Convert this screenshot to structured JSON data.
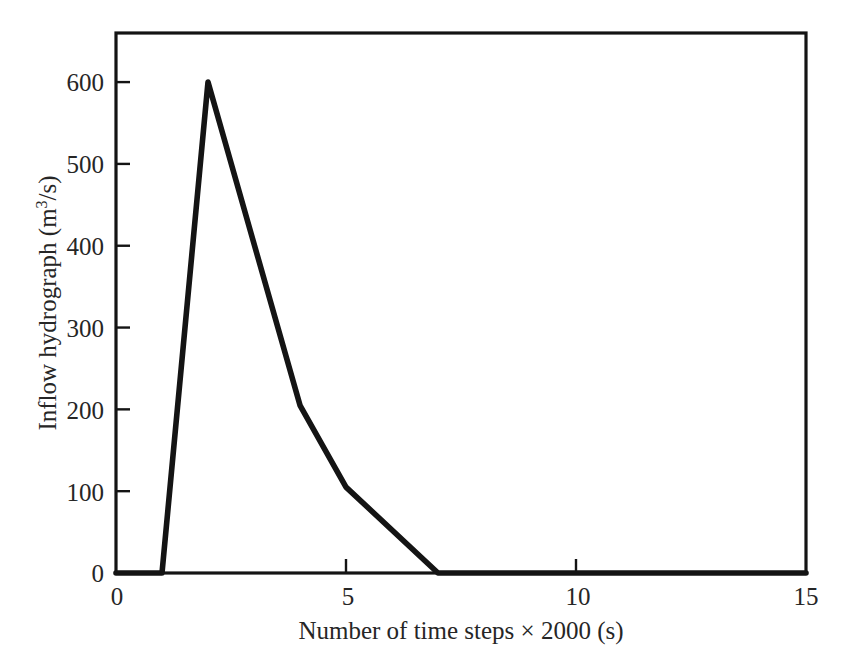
{
  "chart_data": {
    "type": "line",
    "title": "",
    "subtitle": "",
    "xlabel": "Number of time steps × 2000 (s)",
    "ylabel_main": "Inflow hydrograph (m",
    "ylabel_sup": "3",
    "ylabel_tail": "/s)",
    "ylabel": "Inflow hydrograph (m3/s)",
    "xlim": [
      0,
      15
    ],
    "ylim": [
      0,
      660
    ],
    "grid": false,
    "legend": null,
    "x_ticks": [
      0,
      5,
      10,
      15
    ],
    "x_tick_labels": [
      "0",
      "5",
      "10",
      "15"
    ],
    "y_ticks": [
      0,
      100,
      200,
      300,
      400,
      500,
      600
    ],
    "y_tick_labels": [
      "0",
      "100",
      "200",
      "300",
      "400",
      "500",
      "600"
    ],
    "series": [
      {
        "name": "Inflow hydrograph",
        "color": "#141414",
        "x": [
          0,
          1,
          2,
          4,
          5,
          7,
          15
        ],
        "values": [
          0,
          0,
          600,
          205,
          105,
          0,
          0
        ]
      }
    ],
    "annotations": []
  },
  "axes": {
    "frame_color": "#141414",
    "background": "#ffffff"
  }
}
